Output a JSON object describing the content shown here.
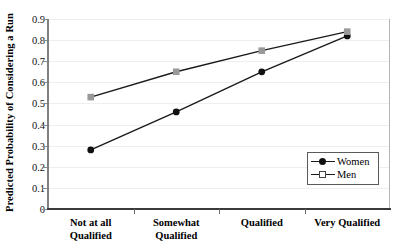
{
  "chart_data": {
    "type": "line",
    "title": "",
    "xlabel": "",
    "ylabel": "Predicted Probability of Considering a Run",
    "categories": [
      "Not at all Qualified",
      "Somewhat Qualified",
      "Qualified",
      "Very Qualified"
    ],
    "series": [
      {
        "name": "Women",
        "values": [
          0.28,
          0.46,
          0.65,
          0.82
        ],
        "marker": "filled-circle",
        "color": "#111111"
      },
      {
        "name": "Men",
        "values": [
          0.53,
          0.65,
          0.75,
          0.84
        ],
        "marker": "gray-square",
        "color": "#999999"
      }
    ],
    "ylim": [
      0,
      0.9
    ],
    "yticks": [
      "0",
      "0.1",
      "0.2",
      "0.3",
      "0.4",
      "0.5",
      "0.6",
      "0.7",
      "0.8",
      "0.9"
    ],
    "ytick_values": [
      0,
      0.1,
      0.2,
      0.3,
      0.4,
      0.5,
      0.6,
      0.7,
      0.8,
      0.9
    ],
    "grid": true,
    "legend_position": "lower-right",
    "line_color": "#1a1a1a"
  },
  "legend": {
    "items": [
      {
        "label": "Women",
        "marker": "filled-circle"
      },
      {
        "label": "Men",
        "marker": "open-square"
      }
    ]
  },
  "axis": {
    "y_title": "Predicted Probability of Considering a Run"
  }
}
